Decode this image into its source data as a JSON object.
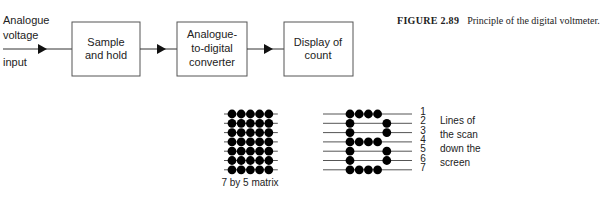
{
  "caption": {
    "label": "FIGURE 2.89",
    "text": "Principle of the digital voltmeter."
  },
  "input_label": [
    "Analogue",
    "voltage",
    "input"
  ],
  "blocks": [
    {
      "id": "sample-and-hold",
      "lines": [
        "Sample",
        "and hold"
      ]
    },
    {
      "id": "adc",
      "lines": [
        "Analogue-",
        "to-digital",
        "converter"
      ]
    },
    {
      "id": "display",
      "lines": [
        "Display of",
        "count"
      ]
    }
  ],
  "matrix_full": {
    "rows": 7,
    "cols": 5,
    "caption": "7 by 5 matrix"
  },
  "matrix_letter": {
    "rows": 7,
    "cols": 5,
    "pattern": [
      [
        1,
        1,
        1,
        1,
        0
      ],
      [
        1,
        0,
        0,
        0,
        1
      ],
      [
        1,
        0,
        0,
        0,
        1
      ],
      [
        1,
        1,
        1,
        1,
        0
      ],
      [
        1,
        0,
        0,
        0,
        1
      ],
      [
        1,
        0,
        0,
        0,
        1
      ],
      [
        1,
        1,
        1,
        1,
        0
      ]
    ],
    "line_numbers": [
      "1",
      "2",
      "3",
      "4",
      "5",
      "6",
      "7"
    ],
    "note": [
      "Lines of",
      "the scan",
      "down the",
      "screen"
    ]
  }
}
